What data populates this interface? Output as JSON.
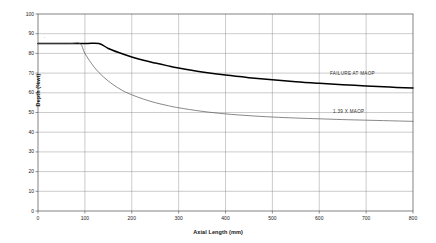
{
  "chart_data": {
    "type": "line",
    "title": "",
    "subtitle": "",
    "xlabel": "Axial Length (mm)",
    "ylabel": "Depth (%wt)",
    "xlim": [
      0,
      800
    ],
    "ylim": [
      0,
      100
    ],
    "xticks": [
      0,
      100,
      200,
      300,
      400,
      500,
      600,
      700,
      800
    ],
    "xtick_labels": [
      "0",
      "100",
      "200",
      "300",
      "400",
      "500",
      "600",
      "700",
      "800"
    ],
    "yticks": [
      0,
      10,
      20,
      30,
      40,
      50,
      60,
      70,
      80,
      90,
      100
    ],
    "ytick_labels": [
      "0",
      "10",
      "20",
      "30",
      "40",
      "50",
      "60",
      "70",
      "80",
      "90",
      "100"
    ],
    "grid": true,
    "grid_color": "#808080",
    "legend": "inline-annotations",
    "series": [
      {
        "name": "FAILURE AT MAOP",
        "style": "bold",
        "color": "#000000",
        "width": 1.5,
        "x": [
          0,
          50,
          100,
          130,
          150,
          175,
          200,
          225,
          250,
          275,
          300,
          350,
          400,
          450,
          500,
          550,
          600,
          650,
          700,
          750,
          800
        ],
        "values": [
          85,
          85,
          85,
          85,
          82.5,
          80.2,
          78.2,
          76.5,
          75.1,
          73.8,
          72.6,
          70.6,
          69.0,
          67.7,
          66.6,
          65.6,
          64.8,
          64.1,
          63.5,
          62.9,
          62.4
        ]
      },
      {
        "name": "1.39 X MAOP",
        "style": "thin",
        "color": "#555555",
        "width": 0.7,
        "x": [
          0,
          40,
          70,
          90,
          100,
          120,
          140,
          160,
          180,
          200,
          225,
          250,
          275,
          300,
          350,
          400,
          450,
          500,
          550,
          600,
          650,
          700,
          750,
          800
        ],
        "values": [
          85,
          85,
          85,
          85,
          80.0,
          73.0,
          68.0,
          64.2,
          61.2,
          59.0,
          56.8,
          55.0,
          53.6,
          52.4,
          50.6,
          49.3,
          48.4,
          47.7,
          47.2,
          46.8,
          46.4,
          46.1,
          45.8,
          45.5
        ]
      }
    ],
    "annotations": [
      {
        "text": "FAILURE AT MAOP",
        "x": 640,
        "y": 70
      },
      {
        "text": "1.39 X MAOP",
        "x": 650,
        "y": 49
      }
    ]
  },
  "axes": {
    "x_axis_label": "Axial Length (mm)",
    "y_axis_label": "Depth (%wt)"
  },
  "labels": {
    "failure_at_maop": "FAILURE AT MAOP",
    "ratio_maop": "1.39 X MAOP"
  },
  "colors": {
    "background": "#ffffff",
    "frame": "#4d4d4d",
    "gridline": "#8c8c8c",
    "bold_curve": "#000000",
    "thin_curve": "#595959",
    "text": "#1a1a1a"
  }
}
